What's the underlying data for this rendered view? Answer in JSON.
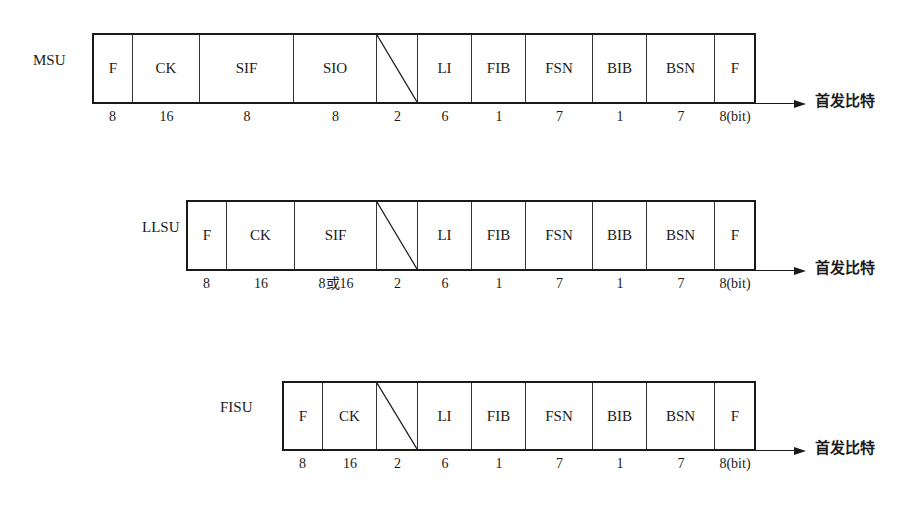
{
  "diagram": {
    "type": "signal-unit-frame-format",
    "first_bit_label": "首发比特",
    "units": [
      {
        "name": "MSU",
        "fields": [
          {
            "label": "F",
            "bits": "8"
          },
          {
            "label": "CK",
            "bits": "16"
          },
          {
            "label": "SIF",
            "bits": "8n(n>2)"
          },
          {
            "label": "SIO",
            "bits": "8"
          },
          {
            "label": "",
            "bits": "2",
            "spare": true
          },
          {
            "label": "LI",
            "bits": "6"
          },
          {
            "label": "FIB",
            "bits": "1"
          },
          {
            "label": "FSN",
            "bits": "7"
          },
          {
            "label": "BIB",
            "bits": "1"
          },
          {
            "label": "BSN",
            "bits": "7"
          },
          {
            "label": "F",
            "bits": "8(bit)"
          }
        ]
      },
      {
        "name": "LLSU",
        "fields": [
          {
            "label": "F",
            "bits": "8"
          },
          {
            "label": "CK",
            "bits": "16"
          },
          {
            "label": "SIF",
            "bits": "8或16"
          },
          {
            "label": "",
            "bits": "2",
            "spare": true
          },
          {
            "label": "LI",
            "bits": "6"
          },
          {
            "label": "FIB",
            "bits": "1"
          },
          {
            "label": "FSN",
            "bits": "7"
          },
          {
            "label": "BIB",
            "bits": "1"
          },
          {
            "label": "BSN",
            "bits": "7"
          },
          {
            "label": "F",
            "bits": "8(bit)"
          }
        ]
      },
      {
        "name": "FISU",
        "fields": [
          {
            "label": "F",
            "bits": "8"
          },
          {
            "label": "CK",
            "bits": "16"
          },
          {
            "label": "",
            "bits": "2",
            "spare": true
          },
          {
            "label": "LI",
            "bits": "6"
          },
          {
            "label": "FIB",
            "bits": "1"
          },
          {
            "label": "FSN",
            "bits": "7"
          },
          {
            "label": "BIB",
            "bits": "1"
          },
          {
            "label": "BSN",
            "bits": "7"
          },
          {
            "label": "F",
            "bits": "8(bit)"
          }
        ]
      }
    ]
  },
  "layout": {
    "rows": [
      {
        "label_x": 33,
        "label_y": 61,
        "top": 33,
        "bottom": 103,
        "bits_y": 117,
        "edges": [
          92,
          133,
          200,
          294,
          377,
          418,
          472,
          526,
          593,
          647,
          715,
          755
        ]
      },
      {
        "label_x": 142,
        "label_y": 228,
        "top": 200,
        "bottom": 270,
        "bits_y": 284,
        "edges": [
          186,
          227,
          295,
          377,
          418,
          472,
          526,
          593,
          647,
          715,
          755
        ]
      },
      {
        "label_x": 220,
        "label_y": 408,
        "top": 381,
        "bottom": 450,
        "bits_y": 464,
        "edges": [
          282,
          323,
          377,
          418,
          472,
          526,
          593,
          647,
          715,
          755
        ]
      }
    ],
    "arrow_end_x": 806,
    "first_bit_x": 815
  }
}
